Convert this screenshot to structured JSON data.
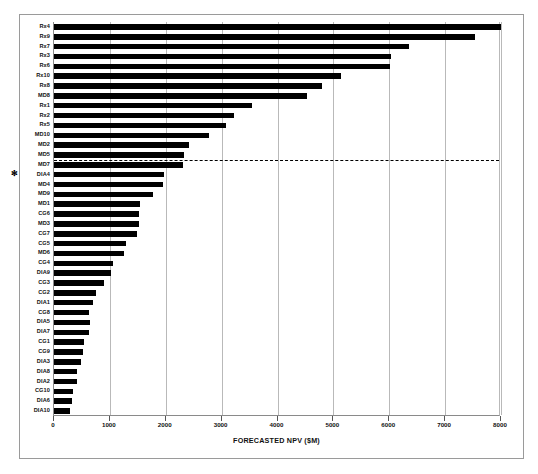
{
  "chart_data": {
    "type": "bar",
    "orientation": "horizontal",
    "title": "",
    "xlabel": "FORECASTED NPV ($M)",
    "ylabel": "",
    "xlim": [
      0,
      8000
    ],
    "xticks": [
      0,
      1000,
      2000,
      3000,
      4000,
      5000,
      6000,
      7000,
      8000
    ],
    "xtick_labels": [
      "0",
      "1000",
      "2000",
      "3000",
      "4000",
      "5000",
      "6000",
      "7000",
      "8000"
    ],
    "grid": "vertical",
    "legend": "none",
    "categories": [
      "Rx4",
      "Rx9",
      "Rx7",
      "Rx3",
      "Rx6",
      "Rx10",
      "Rx8",
      "MD8",
      "Rx1",
      "Rx2",
      "Rx5",
      "MD10",
      "MD2",
      "MD5",
      "MD7",
      "DIA4",
      "MD4",
      "MD9",
      "MD1",
      "CG6",
      "MD3",
      "CG7",
      "CG5",
      "MD6",
      "CG4",
      "DIA9",
      "CG3",
      "CG2",
      "DIA1",
      "CG8",
      "DIA5",
      "DIA7",
      "CG1",
      "CG9",
      "DIA3",
      "DIA8",
      "DIA2",
      "CG10",
      "DIA6",
      "DIA10"
    ],
    "values": [
      8000,
      7530,
      6350,
      6030,
      6020,
      5130,
      4800,
      4520,
      3540,
      3220,
      3080,
      2775,
      2415,
      2325,
      2310,
      1965,
      1950,
      1770,
      1540,
      1520,
      1520,
      1480,
      1290,
      1250,
      1055,
      1020,
      895,
      750,
      700,
      630,
      640,
      630,
      530,
      520,
      490,
      420,
      410,
      340,
      320,
      280
    ],
    "annotations": [
      {
        "name": "threshold-line",
        "style": "dashed",
        "after_category": "MD5",
        "description": "horizontal dashed cutoff line spanning full plot width"
      },
      {
        "name": "asterisk-marker",
        "category": "DIA4",
        "symbol": "✻"
      }
    ]
  }
}
